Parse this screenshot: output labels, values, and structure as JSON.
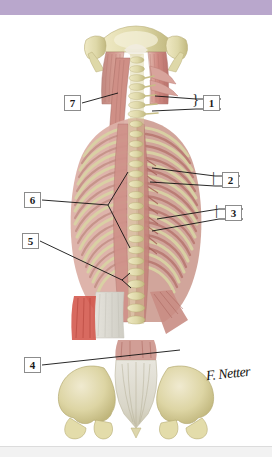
{
  "figure": {
    "attribution": "F. Netter",
    "banner_color": "#b9a7cc",
    "background_color": "#ffffff"
  },
  "labels": [
    {
      "id": "1",
      "text": "1",
      "side": "right",
      "box": {
        "x": 203,
        "y": 95
      },
      "has_brace": true
    },
    {
      "id": "2",
      "text": "2",
      "side": "right",
      "box": {
        "x": 222,
        "y": 172
      },
      "has_brace": true
    },
    {
      "id": "3",
      "text": "3",
      "side": "right",
      "box": {
        "x": 225,
        "y": 205
      },
      "has_brace": true
    },
    {
      "id": "4",
      "text": "4",
      "side": "left",
      "box": {
        "x": 24,
        "y": 357
      },
      "has_brace": false
    },
    {
      "id": "5",
      "text": "5",
      "side": "left",
      "box": {
        "x": 22,
        "y": 233
      },
      "has_brace": false
    },
    {
      "id": "6",
      "text": "6",
      "side": "left",
      "box": {
        "x": 24,
        "y": 192
      },
      "has_brace": false
    },
    {
      "id": "7",
      "text": "7",
      "side": "left",
      "box": {
        "x": 64,
        "y": 95
      },
      "has_brace": false
    }
  ],
  "anatomy": {
    "regions": [
      "occipital-bone",
      "mastoid-process-left",
      "mastoid-process-right",
      "cervical-spine",
      "semispinalis-capitis",
      "splenius-capitis",
      "thoracic-ribs",
      "erector-spinae",
      "spinous-processes",
      "thoracolumbar-aponeurosis",
      "quadratus-lumborum",
      "iliac-crest-left",
      "iliac-crest-right",
      "sacrum",
      "coccyx"
    ]
  },
  "palette": {
    "bone": "#ded8a8",
    "bone_light": "#efe9c4",
    "bone_shadow": "#c2b980",
    "muscle_pink": "#d79a93",
    "muscle_deep": "#b9726c",
    "muscle_pale": "#e3bdb2",
    "muscle_red": "#d3554a",
    "tendon": "#efe7d6",
    "aponeurosis": "#dcdcd6",
    "leader_line": "#111111",
    "label_border": "#8c8c8c"
  }
}
